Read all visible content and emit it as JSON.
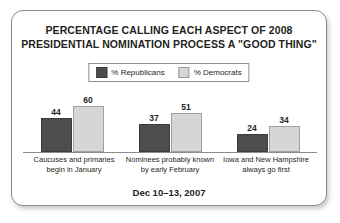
{
  "chart_data": {
    "type": "bar",
    "title": "PERCENTAGE CALLING EACH ASPECT OF 2008 PRESIDENTIAL NOMINATION PROCESS A \"GOOD THING\"",
    "title_lines": [
      "PERCENTAGE CALLING EACH ASPECT OF 2008",
      "PRESIDENTIAL NOMINATION PROCESS A \"GOOD THING\""
    ],
    "subtitle": "Dec 10–13, 2007",
    "xlabel": "",
    "ylabel": "",
    "ylim": [
      0,
      60
    ],
    "grid": false,
    "legend_position": "top-center",
    "categories": [
      "Caucuses and primaries begin in January",
      "Nominees probably known by early February",
      "Iowa and New Hampshire always go first"
    ],
    "category_lines": [
      [
        "Caucuses and primaries",
        "begin in January"
      ],
      [
        "Nominees probably known",
        "by early February"
      ],
      [
        "Iowa and New Hampshire",
        "always go first"
      ]
    ],
    "series": [
      {
        "name": "% Republicans",
        "color": "#4d4d4d",
        "values": [
          44,
          37,
          24
        ]
      },
      {
        "name": "% Democrats",
        "color": "#d6d6d6",
        "values": [
          60,
          51,
          34
        ]
      }
    ]
  },
  "legend": {
    "items": [
      {
        "label": "% Republicans",
        "swatch": "republican-swatch"
      },
      {
        "label": "% Democrats",
        "swatch": "democrat-swatch"
      }
    ]
  },
  "footer": {
    "date_range": "Dec 10–13, 2007"
  },
  "colors": {
    "republican": "#4d4d4d",
    "democrat": "#d6d6d6",
    "text": "#231f20",
    "card_border": "#8a8a8a",
    "axis": "#8c8c8c",
    "background": "#ffffff"
  }
}
